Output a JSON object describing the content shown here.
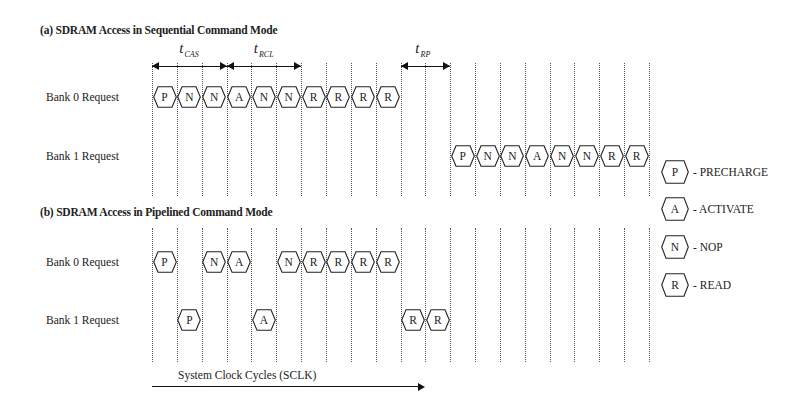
{
  "sections": [
    {
      "id": "a",
      "title": "(a) SDRAM Access in Sequential Command Mode",
      "rows": [
        {
          "label": "Bank 0 Request",
          "commands": [
            {
              "cycle": 0,
              "code": "P"
            },
            {
              "cycle": 1,
              "code": "N"
            },
            {
              "cycle": 2,
              "code": "N"
            },
            {
              "cycle": 3,
              "code": "A"
            },
            {
              "cycle": 4,
              "code": "N"
            },
            {
              "cycle": 5,
              "code": "N"
            },
            {
              "cycle": 6,
              "code": "R"
            },
            {
              "cycle": 7,
              "code": "R"
            },
            {
              "cycle": 8,
              "code": "R"
            },
            {
              "cycle": 9,
              "code": "R"
            }
          ]
        },
        {
          "label": "Bank 1 Request",
          "commands": [
            {
              "cycle": 12,
              "code": "P"
            },
            {
              "cycle": 13,
              "code": "N"
            },
            {
              "cycle": 14,
              "code": "N"
            },
            {
              "cycle": 15,
              "code": "A"
            },
            {
              "cycle": 16,
              "code": "N"
            },
            {
              "cycle": 17,
              "code": "N"
            },
            {
              "cycle": 18,
              "code": "R"
            },
            {
              "cycle": 19,
              "code": "R"
            }
          ]
        }
      ],
      "timings": [
        {
          "name": "t",
          "sub": "CAS",
          "from_cycle": 0,
          "to_cycle": 3
        },
        {
          "name": "t",
          "sub": "RCL",
          "from_cycle": 3,
          "to_cycle": 6
        },
        {
          "name": "t",
          "sub": "RP",
          "from_cycle": 10,
          "to_cycle": 12
        }
      ]
    },
    {
      "id": "b",
      "title": "(b) SDRAM Access in Pipelined Command Mode",
      "rows": [
        {
          "label": "Bank 0 Request",
          "commands": [
            {
              "cycle": 0,
              "code": "P"
            },
            {
              "cycle": 2,
              "code": "N"
            },
            {
              "cycle": 3,
              "code": "A"
            },
            {
              "cycle": 5,
              "code": "N"
            },
            {
              "cycle": 6,
              "code": "R"
            },
            {
              "cycle": 7,
              "code": "R"
            },
            {
              "cycle": 8,
              "code": "R"
            },
            {
              "cycle": 9,
              "code": "R"
            }
          ]
        },
        {
          "label": "Bank 1 Request",
          "commands": [
            {
              "cycle": 1,
              "code": "P"
            },
            {
              "cycle": 4,
              "code": "A"
            },
            {
              "cycle": 10,
              "code": "R"
            },
            {
              "cycle": 11,
              "code": "R"
            }
          ]
        }
      ]
    }
  ],
  "legend": [
    {
      "code": "P",
      "meaning": "- PRECHARGE"
    },
    {
      "code": "A",
      "meaning": "- ACTIVATE"
    },
    {
      "code": "N",
      "meaning": "- NOP"
    },
    {
      "code": "R",
      "meaning": "- READ"
    }
  ],
  "axis": {
    "label": "System Clock Cycles (SCLK)"
  },
  "grid": {
    "num_lines": 21,
    "x0": 152,
    "spacing": 24.85
  }
}
